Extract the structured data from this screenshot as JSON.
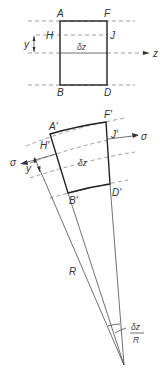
{
  "figure": {
    "top_element": {
      "corner_labels": {
        "A": "A",
        "F": "F",
        "B": "B",
        "D": "D"
      },
      "fibre_labels": {
        "H": "H",
        "J": "J"
      },
      "y_label": "y",
      "length_label": "δz",
      "axis_label": "z"
    },
    "bent_element": {
      "corner_labels": {
        "A": "A'",
        "F": "F'",
        "B": "B'",
        "D": "D'"
      },
      "fibre_labels": {
        "H": "H'",
        "J": "J'"
      },
      "y_label": "y",
      "length_label": "δz",
      "stress_left": "σ",
      "stress_right": "σ",
      "radius_label": "R",
      "angle_label_num": "δz",
      "angle_label_den": "R"
    }
  }
}
